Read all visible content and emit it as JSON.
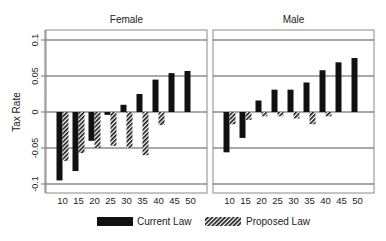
{
  "chart_data": {
    "type": "bar",
    "title": "",
    "ylabel": "Tax Rate",
    "xlabel": "",
    "ylim": [
      -0.115,
      0.115
    ],
    "yticks": [
      -0.1,
      -0.05,
      0,
      0.05,
      0.1
    ],
    "ytick_labels": [
      "-0.1",
      "-0.05",
      "0",
      "0.05",
      "0.1"
    ],
    "grid": true,
    "legend_position": "bottom",
    "categories": [
      "10",
      "15",
      "20",
      "25",
      "30",
      "35",
      "40",
      "45",
      "50"
    ],
    "legend": [
      {
        "name": "Current Law",
        "fill": "solid",
        "color": "#111111"
      },
      {
        "name": "Proposed Law",
        "fill": "hatch",
        "color": "#111111"
      }
    ],
    "panels": [
      {
        "title": "Female",
        "series": [
          {
            "name": "Current Law",
            "values": [
              -0.095,
              -0.082,
              -0.04,
              -0.004,
              0.01,
              0.025,
              0.045,
              0.054,
              0.057
            ]
          },
          {
            "name": "Proposed Law",
            "values": [
              -0.068,
              -0.057,
              -0.05,
              -0.047,
              -0.05,
              -0.06,
              -0.018,
              0.0,
              0.0
            ]
          }
        ]
      },
      {
        "title": "Male",
        "series": [
          {
            "name": "Current Law",
            "values": [
              -0.056,
              -0.036,
              0.016,
              0.031,
              0.031,
              0.041,
              0.058,
              0.069,
              0.075
            ]
          },
          {
            "name": "Proposed Law",
            "values": [
              -0.017,
              -0.011,
              -0.006,
              -0.006,
              -0.009,
              -0.017,
              -0.006,
              0.0,
              0.0
            ]
          }
        ]
      }
    ]
  }
}
